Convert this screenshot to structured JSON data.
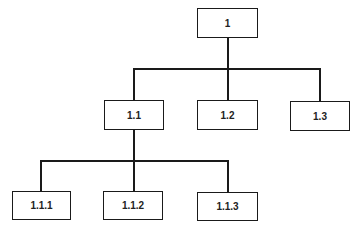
{
  "diagram": {
    "type": "hierarchy-tree",
    "nodes": [
      {
        "id": "1",
        "label": "1",
        "x": 197,
        "y": 8,
        "w": 61,
        "h": 30
      },
      {
        "id": "1.1",
        "label": "1.1",
        "x": 104,
        "y": 100,
        "w": 60,
        "h": 30
      },
      {
        "id": "1.2",
        "label": "1.2",
        "x": 197,
        "y": 100,
        "w": 61,
        "h": 30
      },
      {
        "id": "1.3",
        "label": "1.3",
        "x": 290,
        "y": 101,
        "w": 60,
        "h": 30
      },
      {
        "id": "1.1.1",
        "label": "1.1.1",
        "x": 12,
        "y": 191,
        "w": 59,
        "h": 29
      },
      {
        "id": "1.1.2",
        "label": "1.1.2",
        "x": 103,
        "y": 191,
        "w": 60,
        "h": 29
      },
      {
        "id": "1.1.3",
        "label": "1.1.3",
        "x": 197,
        "y": 192,
        "w": 61,
        "h": 29
      }
    ],
    "edges": [
      {
        "from": "1",
        "to": "1.1"
      },
      {
        "from": "1",
        "to": "1.2"
      },
      {
        "from": "1",
        "to": "1.3"
      },
      {
        "from": "1.1",
        "to": "1.1.1"
      },
      {
        "from": "1.1",
        "to": "1.1.2"
      },
      {
        "from": "1.1",
        "to": "1.1.3"
      }
    ],
    "colors": {
      "stroke": "#1a1a1a",
      "fill": "#ffffff",
      "text": "#222222"
    }
  }
}
